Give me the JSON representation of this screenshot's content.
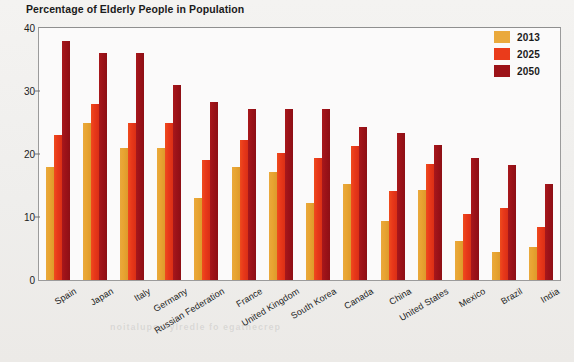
{
  "chart_data": {
    "type": "bar",
    "title": "Percentage of Elderly People in Population",
    "xlabel": "",
    "ylabel": "",
    "ylim": [
      0,
      40
    ],
    "yticks": [
      0,
      10,
      20,
      30,
      40
    ],
    "grid": false,
    "legend_position": "top-right",
    "categories": [
      "Spain",
      "Japan",
      "Italy",
      "Germany",
      "Russian Federation",
      "France",
      "United Kingdom",
      "South Korea",
      "Canada",
      "China",
      "United States",
      "Mexico",
      "Brazil",
      "India"
    ],
    "series": [
      {
        "name": "2013",
        "color": "#eaa93c",
        "values": [
          18.0,
          25.0,
          21.0,
          21.0,
          13.0,
          18.0,
          17.2,
          12.2,
          15.3,
          9.3,
          14.3,
          6.2,
          4.4,
          5.2
        ]
      },
      {
        "name": "2025",
        "color": "#ea3b1b",
        "values": [
          23.0,
          28.0,
          25.0,
          25.0,
          19.0,
          22.2,
          20.2,
          19.3,
          21.3,
          14.2,
          18.4,
          10.4,
          11.4,
          8.4
        ]
      },
      {
        "name": "2050",
        "color": "#9c1218",
        "values": [
          38.0,
          36.0,
          36.0,
          31.0,
          28.2,
          27.2,
          27.2,
          27.2,
          24.3,
          23.4,
          21.4,
          19.4,
          18.3,
          15.3
        ]
      }
    ]
  },
  "legend": {
    "items": [
      {
        "label": "2013",
        "color": "#eaa93c"
      },
      {
        "label": "2025",
        "color": "#ea3b1b"
      },
      {
        "label": "2050",
        "color": "#9c1218"
      }
    ]
  }
}
